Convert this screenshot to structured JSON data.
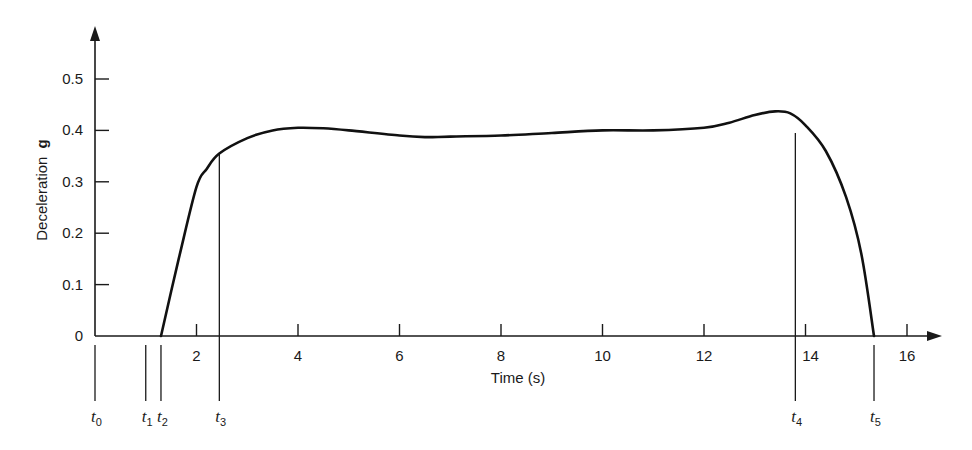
{
  "chart_data": {
    "type": "line",
    "title": "",
    "xlabel": "Time (s)",
    "ylabel": "Deceleration",
    "ylabel_unit": "g",
    "xlim": [
      0,
      16.5
    ],
    "ylim": [
      0,
      0.58
    ],
    "grid": false,
    "legend": null,
    "x_ticks": [
      2,
      4,
      6,
      8,
      10,
      12,
      14,
      16
    ],
    "x_tick_labels": [
      "2",
      "4",
      "6",
      "8",
      "10",
      "12",
      "14",
      "16"
    ],
    "y_ticks": [
      0,
      0.1,
      0.2,
      0.3,
      0.4,
      0.5
    ],
    "y_tick_labels": [
      "0",
      "0.1",
      "0.2",
      "0.3",
      "0.4",
      "0.5"
    ],
    "series": [
      {
        "name": "Deceleration",
        "x": [
          0,
          1.3,
          1.65,
          2.0,
          2.2,
          2.45,
          3.0,
          3.5,
          4.0,
          4.5,
          5.0,
          6.0,
          6.5,
          7.0,
          8.0,
          9.0,
          10.0,
          11.0,
          12.0,
          12.5,
          13.0,
          13.4,
          13.7,
          14.0,
          14.4,
          14.8,
          15.1,
          15.35
        ],
        "y": [
          0,
          0,
          0.15,
          0.29,
          0.325,
          0.355,
          0.385,
          0.4,
          0.405,
          0.404,
          0.4,
          0.39,
          0.387,
          0.388,
          0.39,
          0.395,
          0.4,
          0.4,
          0.405,
          0.415,
          0.43,
          0.437,
          0.433,
          0.41,
          0.36,
          0.27,
          0.16,
          0
        ]
      }
    ],
    "markers": [
      {
        "label": "t",
        "sub": "0",
        "x": 0.0,
        "top": 0
      },
      {
        "label": "t",
        "sub": "1",
        "x": 1.0,
        "top": 0
      },
      {
        "label": "t",
        "sub": "2",
        "x": 1.3,
        "top": 0
      },
      {
        "label": "t",
        "sub": "3",
        "x": 2.45,
        "top": 0.355
      },
      {
        "label": "t",
        "sub": "4",
        "x": 13.8,
        "top": 0.395
      },
      {
        "label": "t",
        "sub": "5",
        "x": 15.35,
        "top": 0
      }
    ]
  }
}
